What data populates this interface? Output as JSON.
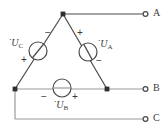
{
  "diagram": {
    "type": "circuit-schematic",
    "stroke_color": "#4a4a4a",
    "text_color": "#3a3a3a",
    "background": "#ffffff",
    "line_width": 1.2
  },
  "terminals": [
    {
      "id": "A",
      "label": "A",
      "x": 148,
      "y": 14,
      "marker": "open-circle"
    },
    {
      "id": "B",
      "label": "B",
      "x": 148,
      "y": 89,
      "marker": "open-circle"
    },
    {
      "id": "C",
      "label": "C",
      "x": 148,
      "y": 119,
      "marker": "open-circle"
    }
  ],
  "nodes": [
    {
      "id": "apex",
      "x": 63,
      "y": 14,
      "marker": "filled-square"
    },
    {
      "id": "left-bottom",
      "x": 15,
      "y": 89,
      "marker": "filled-square"
    },
    {
      "id": "right-bottom",
      "x": 107,
      "y": 89,
      "marker": "filled-square"
    }
  ],
  "sources": [
    {
      "id": "UC",
      "label": "U",
      "subscript": "C",
      "overdot": "˙",
      "cx": 38,
      "cy": 51,
      "r": 9,
      "orientation": "left-diagonal",
      "plus": {
        "sign": "+",
        "x": 24,
        "y": 60
      },
      "minus": {
        "sign": "−",
        "x": 48,
        "y": 33
      },
      "label_x": 10,
      "label_y": 41
    },
    {
      "id": "UA",
      "label": "U",
      "subscript": "A",
      "overdot": "˙",
      "cx": 88,
      "cy": 52,
      "r": 9,
      "orientation": "right-diagonal",
      "plus": {
        "sign": "+",
        "x": 80,
        "y": 33
      },
      "minus": {
        "sign": "−",
        "x": 99,
        "y": 61
      },
      "label_x": 99,
      "label_y": 42
    },
    {
      "id": "UB",
      "label": "U",
      "subscript": "B",
      "overdot": "˙",
      "cx": 62,
      "cy": 88,
      "r": 9,
      "orientation": "horizontal",
      "plus": {
        "sign": "+",
        "x": 74,
        "y": 95
      },
      "minus": {
        "sign": "−",
        "x": 44,
        "y": 95
      },
      "label_x": 54,
      "label_y": 103
    }
  ],
  "wires": [
    {
      "id": "apex-to-A",
      "from": "apex",
      "to": "A",
      "path": "M 63 14 L 143 14"
    },
    {
      "id": "apex-to-left",
      "from": "apex",
      "to": "left-bottom",
      "path": "M 63 14 L 15 89"
    },
    {
      "id": "apex-to-right",
      "from": "apex",
      "to": "right-bottom",
      "path": "M 63 14 L 107 89"
    },
    {
      "id": "bottom-to-B",
      "from": "left-bottom",
      "to": "B",
      "path": "M 15 89 L 143 89"
    },
    {
      "id": "left-down",
      "from": "left-bottom",
      "to": "c-corner",
      "path": "M 15 89 L 15 119"
    },
    {
      "id": "corner-to-C",
      "from": "c-corner",
      "to": "C",
      "path": "M 15 119 L 143 119"
    }
  ]
}
